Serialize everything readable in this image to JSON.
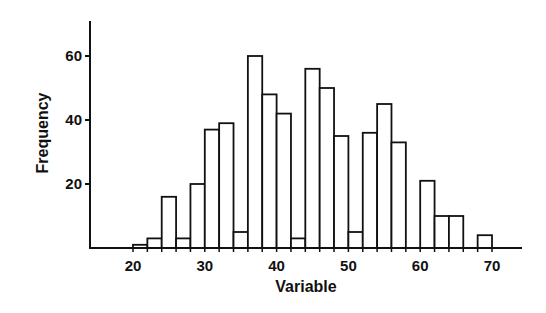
{
  "chart_data": {
    "type": "bar",
    "subtype": "histogram",
    "title": "",
    "xlabel": "Variable",
    "ylabel": "Frequency",
    "bin_width": 2,
    "bin_starts": [
      20,
      22,
      24,
      26,
      28,
      30,
      32,
      34,
      36,
      38,
      40,
      42,
      44,
      46,
      48,
      50,
      52,
      54,
      56,
      58,
      60,
      62,
      64,
      66,
      68
    ],
    "values": [
      1,
      3,
      16,
      3,
      20,
      37,
      39,
      5,
      60,
      48,
      42,
      3,
      56,
      50,
      35,
      5,
      36,
      45,
      33,
      0,
      21,
      10,
      10,
      0,
      4
    ],
    "xticks": [
      20,
      30,
      40,
      50,
      60,
      70
    ],
    "yticks": [
      20,
      40,
      60
    ],
    "xlim": [
      13,
      75
    ],
    "ylim": [
      0,
      71
    ],
    "grid": false,
    "legend": null,
    "bar_fill": "#ffffff",
    "bar_stroke": "#111111"
  }
}
